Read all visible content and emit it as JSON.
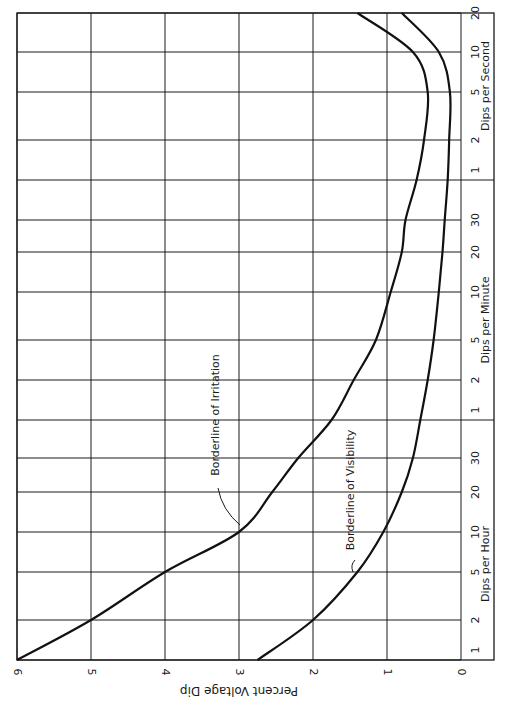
{
  "chart_data": {
    "type": "line",
    "orientation": "rotated-90-clockwise",
    "title": "",
    "ylabel": "Percent Voltage Dip",
    "ylim": [
      0,
      6
    ],
    "yticks": [
      "0",
      "1",
      "2",
      "3",
      "4",
      "5",
      "6"
    ],
    "xlabel_groups": [
      {
        "label": "Dips per Hour",
        "ticks": [
          "1",
          "2",
          "5",
          "10",
          "20",
          "30"
        ]
      },
      {
        "label": "Dips per Minute",
        "ticks": [
          "1",
          "2",
          "5",
          "10",
          "20",
          "30"
        ]
      },
      {
        "label": "Dips per Second",
        "ticks": [
          "1",
          "2",
          "5",
          "10",
          "20"
        ]
      }
    ],
    "x_scale": "logarithmic (frequency)",
    "grid": true,
    "series": [
      {
        "name": "Borderline of Irritation",
        "points": [
          {
            "freq": "1/hr",
            "dip": 6.0
          },
          {
            "freq": "2/hr",
            "dip": 5.0
          },
          {
            "freq": "5/hr",
            "dip": 4.0
          },
          {
            "freq": "10/hr",
            "dip": 3.0
          },
          {
            "freq": "20/hr",
            "dip": 2.55
          },
          {
            "freq": "30/hr",
            "dip": 2.2
          },
          {
            "freq": "1/min",
            "dip": 1.75
          },
          {
            "freq": "2/min",
            "dip": 1.45
          },
          {
            "freq": "5/min",
            "dip": 1.15
          },
          {
            "freq": "10/min",
            "dip": 0.95
          },
          {
            "freq": "20/min",
            "dip": 0.8
          },
          {
            "freq": "30/min",
            "dip": 0.75
          },
          {
            "freq": "1/s",
            "dip": 0.6
          },
          {
            "freq": "2/s",
            "dip": 0.5
          },
          {
            "freq": "5/s",
            "dip": 0.45
          },
          {
            "freq": "10/s",
            "dip": 0.65
          },
          {
            "freq": "20/s",
            "dip": 1.4
          }
        ]
      },
      {
        "name": "Borderline of Visibility",
        "points": [
          {
            "freq": "1/hr",
            "dip": 2.75
          },
          {
            "freq": "2/hr",
            "dip": 2.0
          },
          {
            "freq": "5/hr",
            "dip": 1.4
          },
          {
            "freq": "10/hr",
            "dip": 1.05
          },
          {
            "freq": "20/hr",
            "dip": 0.8
          },
          {
            "freq": "30/hr",
            "dip": 0.65
          },
          {
            "freq": "1/min",
            "dip": 0.55
          },
          {
            "freq": "2/min",
            "dip": 0.45
          },
          {
            "freq": "5/min",
            "dip": 0.37
          },
          {
            "freq": "10/min",
            "dip": 0.3
          },
          {
            "freq": "20/min",
            "dip": 0.25
          },
          {
            "freq": "30/min",
            "dip": 0.22
          },
          {
            "freq": "1/s",
            "dip": 0.18
          },
          {
            "freq": "2/s",
            "dip": 0.16
          },
          {
            "freq": "5/s",
            "dip": 0.15
          },
          {
            "freq": "10/s",
            "dip": 0.3
          },
          {
            "freq": "20/s",
            "dip": 0.8
          }
        ]
      }
    ],
    "annotations": [
      {
        "text": "Borderline of Irritation",
        "points_to": "Irritation curve near 10/hr, 3%"
      },
      {
        "text": "Borderline of Visibility",
        "points_to": "Visibility curve near 5/hr, 1.4%"
      }
    ]
  }
}
